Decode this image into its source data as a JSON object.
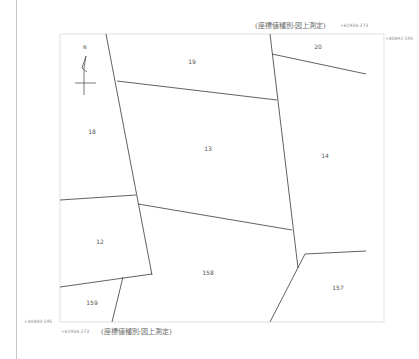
{
  "header": {
    "coord_type_top": "(座標値種別:図上測定)",
    "coord_top_x": "+61934.273",
    "coord_top_y": "+40492.595"
  },
  "footer": {
    "coord_bottom_y": "+40440.595",
    "coord_bottom_x": "+61934.273",
    "coord_type_bottom": "(座標値種別:図上測定)"
  },
  "compass": {
    "north_label": "N"
  },
  "parcels": [
    {
      "id": "20",
      "label": "20"
    },
    {
      "id": "19",
      "label": "19"
    },
    {
      "id": "18",
      "label": "18"
    },
    {
      "id": "13",
      "label": "13"
    },
    {
      "id": "14",
      "label": "14"
    },
    {
      "id": "12",
      "label": "12"
    },
    {
      "id": "158",
      "label": "158"
    },
    {
      "id": "157",
      "label": "157"
    },
    {
      "id": "159",
      "label": "159"
    }
  ],
  "colors": {
    "boundary": "#3a3a3a",
    "frame": "#cfcfcf",
    "text": "#555555"
  }
}
